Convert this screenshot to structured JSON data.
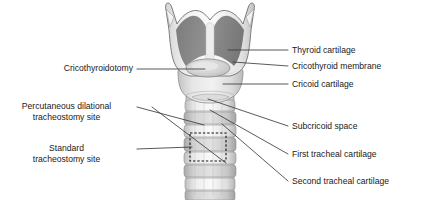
{
  "figure": {
    "type": "anatomical-diagram",
    "width": 425,
    "height": 200,
    "background_color": "#ffffff"
  },
  "colors": {
    "outline": "#4d4d4d",
    "leader_line": "#3c3c3c",
    "text": "#1a1a1a",
    "thyroid_dark_panel": "#838383",
    "thyroid_rim_light": "#ededed",
    "cartilage_light": "#e3e3e3",
    "cartilage_mid": "#cfcfcf",
    "trachea_ring_light": "#e9e9e9",
    "trachea_ring_mid": "#c9c9c9",
    "membrane_fill": "#d8d8d8",
    "dashed_marker": "#111111"
  },
  "labels_right": [
    {
      "id": "thyroid-cartilage",
      "text": "Thyroid cartilage",
      "text_x": 292,
      "text_y": 47,
      "leader_from_x": 288,
      "leader_from_y": 50,
      "leader_to_x": 228,
      "leader_to_y": 50
    },
    {
      "id": "cricothyroid-membrane",
      "text": "Cricothyroid membrane",
      "text_x": 292,
      "text_y": 63,
      "leader_from_x": 288,
      "leader_from_y": 66,
      "leader_to_x": 233,
      "leader_to_y": 62
    },
    {
      "id": "cricoid-cartilage",
      "text": "Cricoid cartilage",
      "text_x": 292,
      "text_y": 81,
      "leader_from_x": 288,
      "leader_from_y": 84,
      "leader_to_x": 223,
      "leader_to_y": 84
    },
    {
      "id": "subcricoid-space",
      "text": "Subcricoid space",
      "text_x": 292,
      "text_y": 123,
      "leader_from_x": 288,
      "leader_from_y": 126,
      "leader_to_x": 208,
      "leader_to_y": 99
    },
    {
      "id": "first-tracheal-cartilage",
      "text": "First tracheal cartilage",
      "text_x": 292,
      "text_y": 151,
      "leader_from_x": 288,
      "leader_from_y": 154,
      "leader_to_x": 210,
      "leader_to_y": 110
    },
    {
      "id": "second-tracheal-cartilage",
      "text": "Second tracheal cartilage",
      "text_x": 292,
      "text_y": 178,
      "leader_from_x": 288,
      "leader_from_y": 181,
      "leader_to_x": 222,
      "leader_to_y": 124
    }
  ],
  "labels_left": [
    {
      "id": "cricothyroidotomy",
      "lines": [
        "Cricothyroidotomy"
      ],
      "text_right_x": 133,
      "text_y": 65,
      "leader_from_x": 137,
      "leader_from_y": 69,
      "leader_to_x": 205,
      "leader_to_y": 69
    },
    {
      "id": "percutaneous-dilational-tracheostomy-site",
      "lines": [
        "Percutaneous dilational",
        "tracheostomy site"
      ],
      "text_right_x": 133,
      "text_y": 103,
      "leader_from_x": 137,
      "leader_from_y": 107,
      "leader_to_x": 204,
      "leader_to_y": 125,
      "extra_leader_to_x": 226,
      "extra_leader_to_y": 163
    },
    {
      "id": "standard-tracheostomy-site",
      "lines": [
        "Standard",
        "tracheostomy site"
      ],
      "text_right_x": 133,
      "text_y": 145,
      "leader_from_x": 137,
      "leader_from_y": 149,
      "leader_to_x": 192,
      "leader_to_y": 147
    }
  ],
  "markers": {
    "standard_tracheostomy_box": {
      "label": "dashed rectangle marking standard tracheostomy site",
      "x": 190,
      "y": 133,
      "width": 36,
      "height": 28
    }
  },
  "anatomy_parts": [
    {
      "id": "thyroid-cartilage-body",
      "name": "Thyroid cartilage"
    },
    {
      "id": "superior-horn-left",
      "name": "Left superior horn"
    },
    {
      "id": "superior-horn-right",
      "name": "Right superior horn"
    },
    {
      "id": "thyroid-notch",
      "name": "Superior thyroid notch"
    },
    {
      "id": "cricothyroid-membrane",
      "name": "Cricothyroid membrane"
    },
    {
      "id": "cricoid-cartilage-body",
      "name": "Cricoid cartilage"
    },
    {
      "id": "subcricoid-space-region",
      "name": "Subcricoid space"
    },
    {
      "id": "tracheal-ring-1",
      "name": "First tracheal cartilage"
    },
    {
      "id": "tracheal-ring-2",
      "name": "Second tracheal cartilage"
    },
    {
      "id": "tracheal-ring-3",
      "name": "Third tracheal cartilage"
    },
    {
      "id": "tracheal-ring-4",
      "name": "Fourth tracheal cartilage"
    },
    {
      "id": "tracheal-ring-5",
      "name": "Fifth tracheal cartilage"
    },
    {
      "id": "trachea-shaft",
      "name": "Trachea"
    }
  ]
}
